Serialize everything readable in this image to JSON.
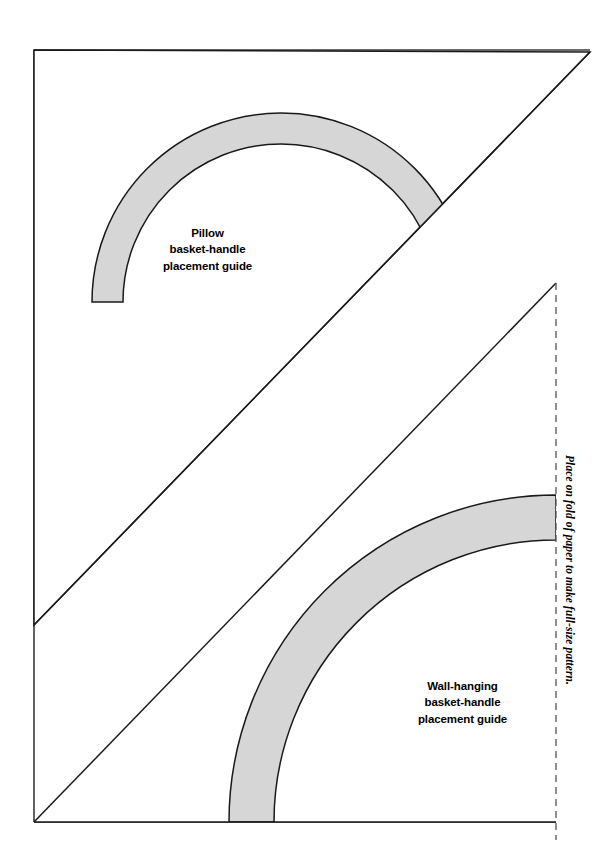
{
  "document": {
    "type": "sewing-pattern-sheet",
    "page_width": 609,
    "page_height": 863,
    "background_color": "#ffffff",
    "border_color": "#1a1a1a"
  },
  "colors": {
    "outline": "#1a1a1a",
    "handle_band_fill": "#d6d6d6",
    "handle_band_stroke": "#1a1a1a",
    "fold_line": "#555555",
    "text": "#000000"
  },
  "upper_pattern": {
    "name": "pillow-template",
    "label_lines": [
      "Pillow",
      "basket-handle",
      "placement guide"
    ],
    "shape": "right-triangle",
    "vertices": [
      [
        34,
        50
      ],
      [
        590,
        52
      ],
      [
        34,
        625
      ]
    ],
    "handle_arc": {
      "center": [
        281,
        302
      ],
      "outer_radius": 189,
      "inner_radius": 158,
      "start_angle_deg": 188,
      "end_angle_deg": 350
    }
  },
  "lower_pattern": {
    "name": "wall-hanging-template",
    "label_lines": [
      "Wall-hanging",
      "basket-handle",
      "placement guide"
    ],
    "shape": "right-triangle",
    "vertices": [
      [
        34,
        822
      ],
      [
        556,
        283
      ],
      [
        556,
        822
      ]
    ],
    "handle_arc": {
      "center": [
        556,
        822
      ],
      "outer_radius": 327,
      "inner_radius": 282,
      "start_angle_deg": 180,
      "end_angle_deg": 270
    }
  },
  "fold_edge": {
    "note": "Place on fold of paper to make full-size pattern.",
    "line_style": "dashed",
    "x": 556,
    "y_start": 283,
    "y_end": 838
  }
}
